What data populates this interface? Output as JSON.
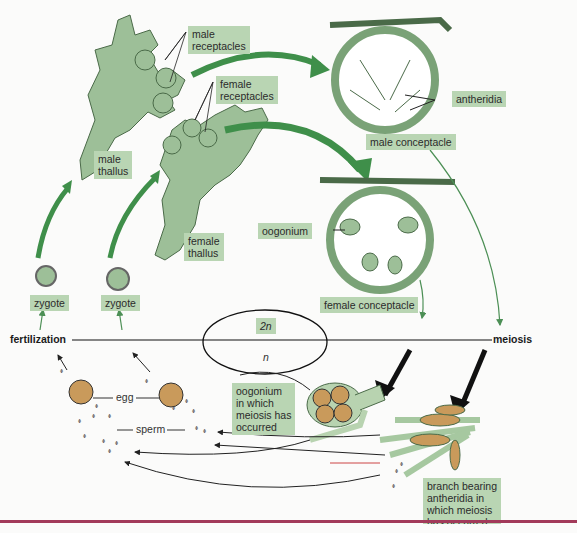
{
  "figure": {
    "labels": {
      "male_receptacles": "male\nreceptacles",
      "female_receptacles": "female\nreceptacles",
      "antheridia": "antheridia",
      "male_conceptacle": "male conceptacle",
      "male_thallus": "male\nthallus",
      "female_thallus": "female\nthallus",
      "oogonium": "oogonium",
      "female_conceptacle": "female conceptacle",
      "zygote_left": "zygote",
      "zygote_right": "zygote",
      "fertilization": "fertilization",
      "meiosis": "meiosis",
      "diploid": "2n",
      "haploid": "n",
      "egg": "egg",
      "sperm": "sperm",
      "oogonium_meiosis": "oogonium\nin which\nmeiosis has\noccurred",
      "branch_antheridia": "branch bearing\nantheridia in\nwhich meiosis\nhas occurred"
    },
    "colors": {
      "label_bg": "#b9d5b3",
      "thallus_fill": "#9dbf98",
      "arrow_green": "#3f8f4a",
      "egg_fill": "#c99a5b",
      "rule": "#a23a5a"
    }
  }
}
